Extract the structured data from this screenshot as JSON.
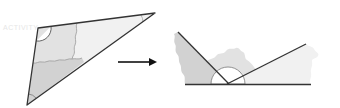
{
  "figure": {
    "faint_label": "ACTIVITY",
    "colors": {
      "outline": "#333333",
      "piece_dark": "#d2d2d2",
      "piece_mid": "#e2e2e2",
      "piece_light": "#f1f1f1",
      "cut_line": "#9a9a9a",
      "background": "#ffffff"
    },
    "original_triangle": {
      "vertices": [
        [
          38,
          28
        ],
        [
          155,
          13
        ],
        [
          27,
          105
        ]
      ],
      "pieces": [
        "top-left-corner",
        "right-corner",
        "bottom-corner"
      ]
    },
    "arrow": {
      "from": [
        118,
        62
      ],
      "to": [
        157,
        62
      ],
      "direction": "right"
    },
    "rearranged": {
      "baseline": {
        "from": [
          185,
          84
        ],
        "to": [
          311,
          84
        ]
      },
      "meeting_point": [
        228,
        84
      ],
      "pieces": [
        "bottom-corner (left)",
        "top-left-corner (middle)",
        "right-corner (right)"
      ]
    }
  }
}
